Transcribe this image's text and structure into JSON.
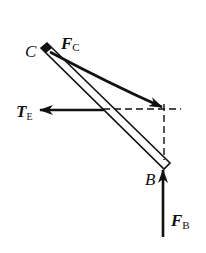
{
  "diagram": {
    "type": "free-body-diagram",
    "ink_color": "#111111",
    "background": "#ffffff",
    "bar": {
      "name": "bar CB",
      "end_top": "C",
      "end_bottom": "B"
    },
    "points": {
      "C": {
        "label": "C"
      },
      "B": {
        "label": "B"
      }
    },
    "forces": [
      {
        "id": "FC",
        "symbol": "F",
        "subscript": "C",
        "direction": "down-right, curved toward dashed intersection"
      },
      {
        "id": "TE",
        "symbol": "T",
        "subscript": "E",
        "direction": "left (horizontal)"
      },
      {
        "id": "FB",
        "symbol": "F",
        "subscript": "B",
        "direction": "up (vertical)"
      }
    ],
    "construction_lines": [
      {
        "style": "dashed",
        "orientation": "horizontal"
      },
      {
        "style": "dashed",
        "orientation": "vertical"
      }
    ]
  }
}
